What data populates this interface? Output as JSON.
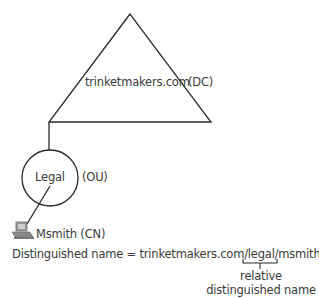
{
  "domain_node": {
    "name": "trinketmakers.com",
    "type_label": "(DC)",
    "shape": "triangle"
  },
  "ou_node": {
    "name": "Legal",
    "type_label": "(OU)",
    "shape": "circle"
  },
  "cn_node": {
    "name": "Msmith (CN)",
    "icon": "computer-icon"
  },
  "distinguished_name": {
    "prefix": "Distinguished name = trinketmakers.com/legal/",
    "rdn_part": "msmith"
  },
  "rdn_annotation": {
    "line1": "relative",
    "line2": "distinguished name"
  },
  "colors": {
    "line": "#2a2a2a",
    "text": "#3a3a3a"
  }
}
